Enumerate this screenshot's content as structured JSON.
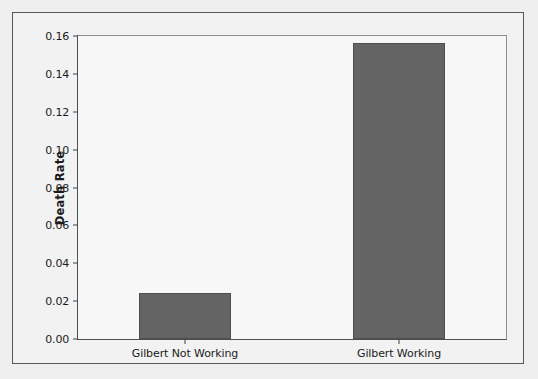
{
  "chart_data": {
    "type": "bar",
    "title": "",
    "xlabel": "",
    "ylabel": "Death Rate",
    "categories": [
      "Gilbert Not Working",
      "Gilbert Working"
    ],
    "values": [
      0.0245,
      0.1565
    ],
    "ylim": [
      0.0,
      0.16
    ],
    "ytick_labels": [
      "0.00",
      "0.02",
      "0.04",
      "0.06",
      "0.08",
      "0.10",
      "0.12",
      "0.14",
      "0.16"
    ],
    "ytick_values": [
      0.0,
      0.02,
      0.04,
      0.06,
      0.08,
      0.1,
      0.12,
      0.14,
      0.16
    ],
    "grid": false,
    "legend": null,
    "bar_color": "#646464",
    "plot_background": "#f7f7f7",
    "figure_background": "#f2f2f2",
    "axis_color": "#3d4246"
  }
}
